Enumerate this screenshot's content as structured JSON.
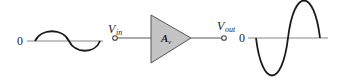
{
  "diagram": {
    "type": "amplifier-block",
    "input": {
      "zero_label": "0",
      "terminal_label_main": "V",
      "terminal_label_sub": "in",
      "waveform": "sine",
      "amplitude_px": 10
    },
    "amplifier": {
      "gain_label_main": "A",
      "gain_label_sub": "v",
      "fill_color": "#c4c4c4",
      "stroke_color": "#555555"
    },
    "output": {
      "zero_label": "0",
      "terminal_label_main": "V",
      "terminal_label_sub": "out",
      "waveform": "inverted sine (larger amplitude)",
      "amplitude_px": 38
    },
    "colors": {
      "waveform": "#1a1a1a",
      "axis": "#888888",
      "wire": "#555555"
    }
  }
}
